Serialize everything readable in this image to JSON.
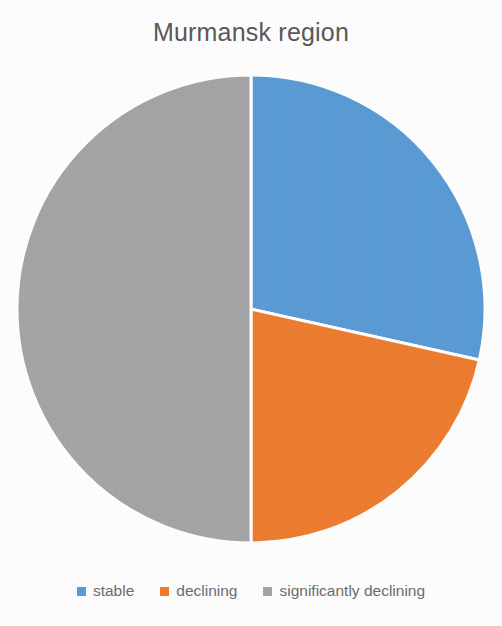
{
  "chart_data": {
    "type": "pie",
    "title": "Murmansk region",
    "xlabel": "",
    "ylabel": "",
    "categories": [
      "stable",
      "declining",
      "significantly declining"
    ],
    "values": [
      28.5,
      21.5,
      50
    ],
    "value_unit": "percent",
    "colors": [
      "#5B9BD5",
      "#ED7D31",
      "#A5A5A5"
    ],
    "start_angle_deg": 0,
    "direction": "clockwise",
    "slice_border_color": "#FFFFFF",
    "slice_border_width": 3,
    "legend": {
      "position": "bottom",
      "entries": [
        {
          "label": "stable",
          "color": "#5B9BD5"
        },
        {
          "label": "declining",
          "color": "#ED7D31"
        },
        {
          "label": "significantly declining",
          "color": "#A5A5A5"
        }
      ]
    },
    "grid": false,
    "data_labels_visible": false
  },
  "chart": {
    "title": "Murmansk region",
    "background_color": "#FFFFFF",
    "title_color": "#5A5A5A",
    "legend_text_color": "#6D6D6D"
  },
  "slices": [
    {
      "name": "stable",
      "percent": 28.5,
      "color": "#5B9BD5"
    },
    {
      "name": "declining",
      "percent": 21.5,
      "color": "#ED7D31"
    },
    {
      "name": "significantly declining",
      "percent": 50,
      "color": "#A5A5A5"
    }
  ],
  "legend": {
    "items": [
      {
        "label": "stable",
        "color": "#5B9BD5",
        "marker": "square-marker-blue"
      },
      {
        "label": "declining",
        "color": "#ED7D31",
        "marker": "square-marker-orange"
      },
      {
        "label": "significantly declining",
        "color": "#A5A5A5",
        "marker": "square-marker-gray"
      }
    ]
  }
}
